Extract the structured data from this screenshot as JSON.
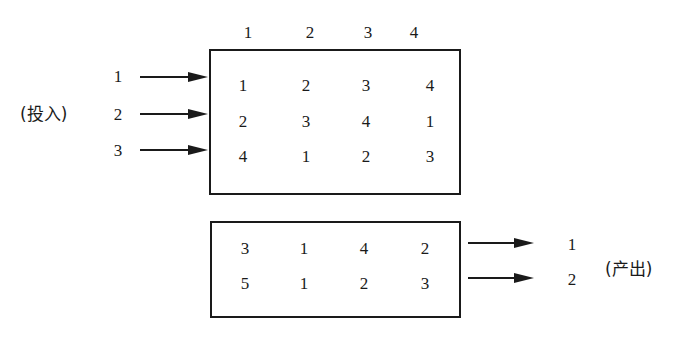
{
  "input_label": "(投入)",
  "output_label": "(产出)",
  "column_headers": [
    "1",
    "2",
    "3",
    "4"
  ],
  "input_rows": [
    "1",
    "2",
    "3"
  ],
  "input_matrix": [
    [
      "1",
      "2",
      "3",
      "4"
    ],
    [
      "2",
      "3",
      "4",
      "1"
    ],
    [
      "4",
      "1",
      "2",
      "3"
    ]
  ],
  "output_matrix": [
    [
      "3",
      "1",
      "4",
      "2"
    ],
    [
      "5",
      "1",
      "2",
      "3"
    ]
  ],
  "output_rows": [
    "1",
    "2"
  ],
  "colors": {
    "ink": "#1a1a1a",
    "background": "#ffffff"
  }
}
